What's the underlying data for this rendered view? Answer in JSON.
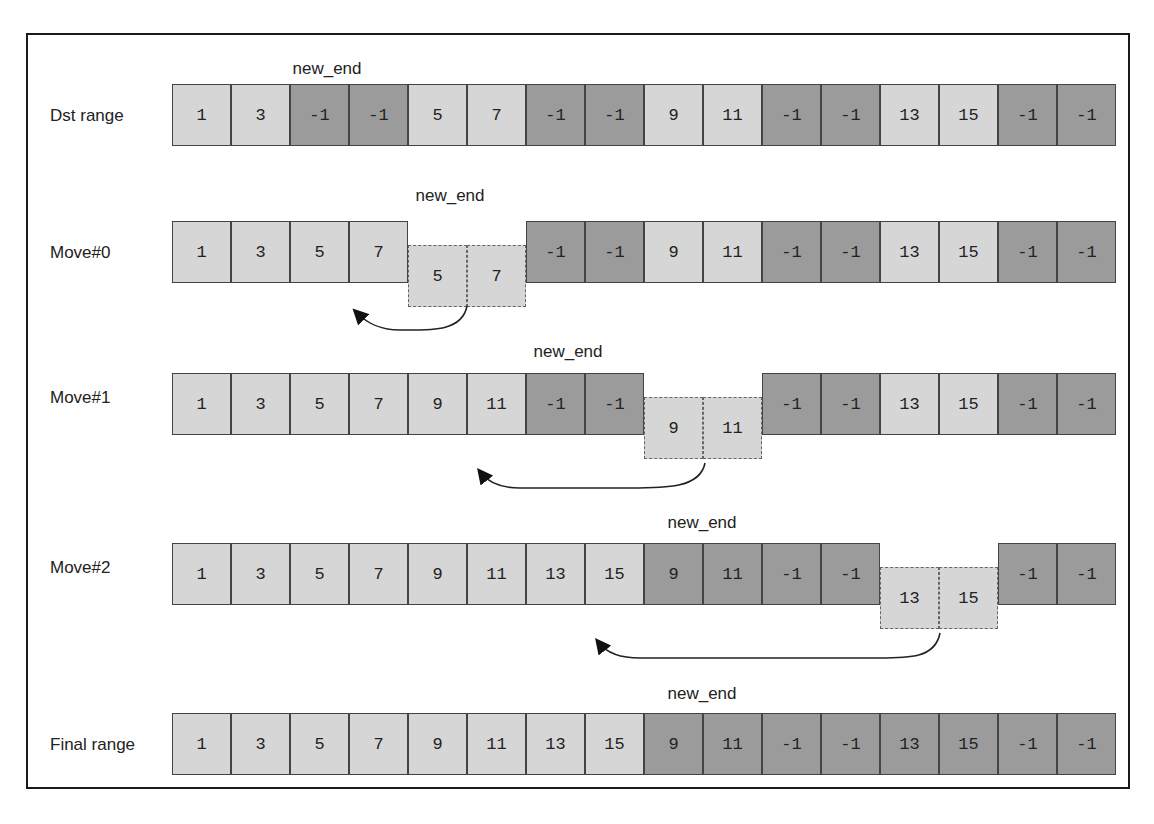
{
  "diagram": {
    "marker_label": "new_end",
    "colors": {
      "light": "#d6d6d6",
      "dark": "#9b9b9b",
      "border": "#444444"
    },
    "rows": [
      {
        "label": "Dst range",
        "top": 84,
        "label_y": 106,
        "marker_x": 327,
        "marker_y": 59,
        "cells": [
          {
            "v": "1",
            "t": "light"
          },
          {
            "v": "3",
            "t": "light"
          },
          {
            "v": "-1",
            "t": "dark"
          },
          {
            "v": "-1",
            "t": "dark"
          },
          {
            "v": "5",
            "t": "light"
          },
          {
            "v": "7",
            "t": "light"
          },
          {
            "v": "-1",
            "t": "dark"
          },
          {
            "v": "-1",
            "t": "dark"
          },
          {
            "v": "9",
            "t": "light"
          },
          {
            "v": "11",
            "t": "light"
          },
          {
            "v": "-1",
            "t": "dark"
          },
          {
            "v": "-1",
            "t": "dark"
          },
          {
            "v": "13",
            "t": "light"
          },
          {
            "v": "15",
            "t": "light"
          },
          {
            "v": "-1",
            "t": "dark"
          },
          {
            "v": "-1",
            "t": "dark"
          }
        ]
      },
      {
        "label": "Move#0",
        "top": 221,
        "label_y": 243,
        "marker_x": 450,
        "marker_y": 186,
        "cells": [
          {
            "v": "1",
            "t": "light"
          },
          {
            "v": "3",
            "t": "light"
          },
          {
            "v": "5",
            "t": "light"
          },
          {
            "v": "7",
            "t": "light"
          },
          {
            "v": "5",
            "t": "moved"
          },
          {
            "v": "7",
            "t": "moved"
          },
          {
            "v": "-1",
            "t": "dark"
          },
          {
            "v": "-1",
            "t": "dark"
          },
          {
            "v": "9",
            "t": "light"
          },
          {
            "v": "11",
            "t": "light"
          },
          {
            "v": "-1",
            "t": "dark"
          },
          {
            "v": "-1",
            "t": "dark"
          },
          {
            "v": "13",
            "t": "light"
          },
          {
            "v": "15",
            "t": "light"
          },
          {
            "v": "-1",
            "t": "dark"
          },
          {
            "v": "-1",
            "t": "dark"
          }
        ]
      },
      {
        "label": "Move#1",
        "top": 373,
        "label_y": 388,
        "marker_x": 568,
        "marker_y": 342,
        "cells": [
          {
            "v": "1",
            "t": "light"
          },
          {
            "v": "3",
            "t": "light"
          },
          {
            "v": "5",
            "t": "light"
          },
          {
            "v": "7",
            "t": "light"
          },
          {
            "v": "9",
            "t": "light"
          },
          {
            "v": "11",
            "t": "light"
          },
          {
            "v": "-1",
            "t": "dark"
          },
          {
            "v": "-1",
            "t": "dark"
          },
          {
            "v": "9",
            "t": "moved"
          },
          {
            "v": "11",
            "t": "moved"
          },
          {
            "v": "-1",
            "t": "dark"
          },
          {
            "v": "-1",
            "t": "dark"
          },
          {
            "v": "13",
            "t": "light"
          },
          {
            "v": "15",
            "t": "light"
          },
          {
            "v": "-1",
            "t": "dark"
          },
          {
            "v": "-1",
            "t": "dark"
          }
        ]
      },
      {
        "label": "Move#2",
        "top": 543,
        "label_y": 558,
        "marker_x": 702,
        "marker_y": 513,
        "cells": [
          {
            "v": "1",
            "t": "light"
          },
          {
            "v": "3",
            "t": "light"
          },
          {
            "v": "5",
            "t": "light"
          },
          {
            "v": "7",
            "t": "light"
          },
          {
            "v": "9",
            "t": "light"
          },
          {
            "v": "11",
            "t": "light"
          },
          {
            "v": "13",
            "t": "light"
          },
          {
            "v": "15",
            "t": "light"
          },
          {
            "v": "9",
            "t": "dark"
          },
          {
            "v": "11",
            "t": "dark"
          },
          {
            "v": "-1",
            "t": "dark"
          },
          {
            "v": "-1",
            "t": "dark"
          },
          {
            "v": "13",
            "t": "moved"
          },
          {
            "v": "15",
            "t": "moved"
          },
          {
            "v": "-1",
            "t": "dark"
          },
          {
            "v": "-1",
            "t": "dark"
          }
        ]
      },
      {
        "label": "Final range",
        "top": 713,
        "label_y": 735,
        "marker_x": 702,
        "marker_y": 684,
        "cells": [
          {
            "v": "1",
            "t": "light"
          },
          {
            "v": "3",
            "t": "light"
          },
          {
            "v": "5",
            "t": "light"
          },
          {
            "v": "7",
            "t": "light"
          },
          {
            "v": "9",
            "t": "light"
          },
          {
            "v": "11",
            "t": "light"
          },
          {
            "v": "13",
            "t": "light"
          },
          {
            "v": "15",
            "t": "light"
          },
          {
            "v": "9",
            "t": "dark"
          },
          {
            "v": "11",
            "t": "dark"
          },
          {
            "v": "-1",
            "t": "dark"
          },
          {
            "v": "-1",
            "t": "dark"
          },
          {
            "v": "13",
            "t": "dark"
          },
          {
            "v": "15",
            "t": "dark"
          },
          {
            "v": "-1",
            "t": "dark"
          },
          {
            "v": "-1",
            "t": "dark"
          }
        ]
      }
    ],
    "arrows": [
      {
        "from": "moved cells 5,7",
        "to": "index 3",
        "path": "M467,306 C462,332 430,330 400,330 C378,330 366,322 357,313"
      },
      {
        "from": "moved cells 9,11",
        "to": "index 5",
        "path": "M705,463 C700,490 660,488 620,488 L520,488 C500,488 488,482 481,473"
      },
      {
        "from": "moved cells 13,15",
        "to": "index 7",
        "path": "M940,633 C935,660 905,658 870,658 L640,658 C618,658 606,652 599,643"
      }
    ]
  }
}
